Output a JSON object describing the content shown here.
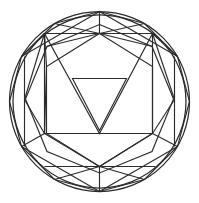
{
  "figure": {
    "background_color": "#ffffff",
    "stroke_color": "#2b2b2b",
    "stroke_width": 1.15,
    "canvas": {
      "width": 199,
      "height": 203
    },
    "center": {
      "x": 99.5,
      "y": 101.5
    },
    "outer_radius": 90
  },
  "shapes": {
    "outer_circle": {
      "name": "outer-circle",
      "cx": 99.5,
      "cy": 101.5,
      "r": 90
    },
    "inner_circle": {
      "name": "inner-circle",
      "cx": 99.5,
      "cy": 101.5,
      "r": 86.5
    },
    "dodecagon": {
      "name": "outer-dodecagon",
      "sides": 12,
      "points": "99.5,11.5 144.5,23.5 177.5,56.5 189.5,101.5 177.5,146.5 144.5,179.5 99.5,191.5 54.5,179.5 21.5,146.5 9.5,101.5 21.5,56.5 54.5,23.5"
    },
    "octagon": {
      "name": "inner-octagon",
      "sides": 8,
      "points": "99.5,24.5 152.0,46.5 173.5,99.0 152.0,151.5 99.5,173.0 47.0,151.5 25.5,99.0 47.0,46.5"
    },
    "square": {
      "name": "inner-square",
      "points": "44.5,33.5 152.5,33.5 152.5,133.5 44.5,133.5"
    },
    "hexagon": {
      "name": "inner-hexagon",
      "sides": 6,
      "points": "99.5,33.5 152.5,66.5 152.5,133.5 99.5,166.5 46.5,133.5 46.5,66.5"
    },
    "triangle_down": {
      "name": "inner-triangle-down",
      "points": "72.5,78.5 126.5,78.5 99.5,130.5"
    },
    "triangle_large": {
      "name": "large-triangle-down",
      "points": "44.5,33.5 152.5,33.5 99.5,133.5"
    }
  },
  "spokes": {
    "name": "radial-spokes",
    "from_top_vertex": {
      "x": 99.5,
      "y": 33.5
    },
    "from_bottom_vertex": {
      "x": 99.5,
      "y": 166.5
    }
  },
  "legend": {
    "visible": false,
    "entries": []
  },
  "labels": {
    "visible": false,
    "items": []
  }
}
